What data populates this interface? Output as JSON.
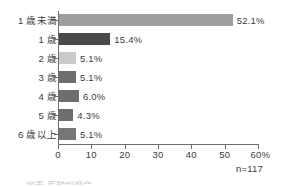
{
  "chart_data": {
    "type": "bar",
    "orientation": "horizontal",
    "title": "",
    "xlabel": "",
    "ylabel": "",
    "categories": [
      "1 歳未満",
      "1 歳",
      "2 歳",
      "3 歳",
      "4 歳",
      "5 歳",
      "6 歳以上"
    ],
    "values": [
      52.1,
      15.4,
      5.1,
      5.1,
      6.0,
      4.3,
      5.1
    ],
    "value_labels": [
      "52.1%",
      "15.4%",
      "5.1%",
      "5.1%",
      "6.0%",
      "4.3%",
      "5.1%"
    ],
    "bar_colors": [
      "#9d9d9d",
      "#4a4a4a",
      "#c9c9c9",
      "#6e6e6e",
      "#6e6e6e",
      "#6e6e6e",
      "#767676"
    ],
    "xlim": [
      0,
      60
    ],
    "xticks": [
      0,
      10,
      20,
      30,
      40,
      50,
      60
    ],
    "xtick_labels": [
      "0",
      "10",
      "20",
      "30",
      "40",
      "50",
      "60%"
    ],
    "grid": false,
    "legend": "none",
    "annotations": [
      "n=117"
    ]
  },
  "footnote": {
    "sample_size": "n=117"
  },
  "caption": {
    "cut_off_text": "図表  年齢別割合"
  },
  "colors": {
    "axis": "#6e6e6e",
    "text": "#3b3b3b",
    "background": "#ffffff"
  }
}
